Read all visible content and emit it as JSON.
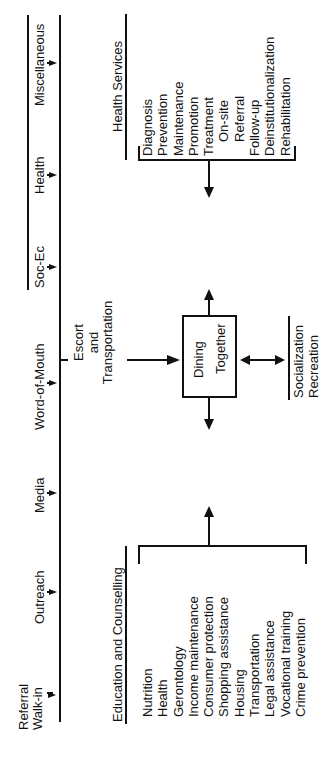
{
  "referral_sources": {
    "items": [
      {
        "label": "Referral\nWalk-in",
        "line1": "Referral",
        "line2": "Walk-in"
      },
      {
        "label": "Outreach"
      },
      {
        "label": "Media"
      },
      {
        "label": "Word-of-Mouth"
      },
      {
        "label": "Soc-Ec"
      },
      {
        "label": "Health"
      },
      {
        "label": "Miscellaneous"
      }
    ]
  },
  "escort": {
    "line1": "Escort",
    "line2": "and",
    "line3": "Transportation"
  },
  "center": {
    "line1": "Dining",
    "line2": "Together"
  },
  "socialization": {
    "line1": "Socialization",
    "line2": "Recreation"
  },
  "education": {
    "title": "Education and Counselling",
    "items": [
      "Nutrition",
      "Health",
      "Gerontology",
      "Income maintenance",
      "Consumer protection",
      "Shopping assistance",
      "Housing",
      "Transportation",
      "Legal assistance",
      "Vocational training",
      "Crime prevention"
    ]
  },
  "health_services": {
    "title": "Health Services",
    "items": [
      "Diagnosis",
      "Prevention",
      "Maintenance",
      "Promotion",
      "Treatment",
      "On-site",
      "Referral",
      "Follow-up",
      "Deinstitutionalization",
      "Rehabilitation"
    ]
  }
}
